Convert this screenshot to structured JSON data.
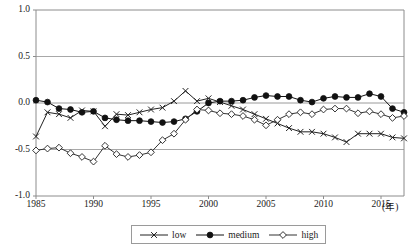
{
  "chart_data": {
    "type": "line",
    "title": "",
    "xlabel": "(年)",
    "ylabel": "",
    "xlim": [
      1985,
      2017
    ],
    "ylim": [
      -1.0,
      1.0
    ],
    "grid": true,
    "grid_axis": "y",
    "legend_position": "bottom-center",
    "y_ticks": [
      "1.0",
      "0.5",
      "0.0",
      "-0.5",
      "-1.0"
    ],
    "y_tick_values": [
      1.0,
      0.5,
      0.0,
      -0.5,
      -1.0
    ],
    "x_ticks": [
      "1985",
      "1990",
      "1995",
      "2000",
      "2005",
      "2010",
      "2015"
    ],
    "x_tick_values": [
      1985,
      1990,
      1995,
      2000,
      2005,
      2010,
      2015
    ],
    "x_axis_unit_label": "(年)",
    "x": [
      1985,
      1986,
      1987,
      1988,
      1989,
      1990,
      1991,
      1992,
      1993,
      1994,
      1995,
      1996,
      1997,
      1998,
      1999,
      2000,
      2001,
      2002,
      2003,
      2004,
      2005,
      2006,
      2007,
      2008,
      2009,
      2010,
      2011,
      2012,
      2013,
      2014,
      2015,
      2016,
      2017
    ],
    "series": [
      {
        "name": "low",
        "marker": "x-cross",
        "marker_fill": "none",
        "color": "#222222",
        "values": [
          -0.36,
          -0.1,
          -0.12,
          -0.16,
          -0.08,
          -0.09,
          -0.25,
          -0.12,
          -0.13,
          -0.1,
          -0.07,
          -0.05,
          0.02,
          0.13,
          0.02,
          0.05,
          0.01,
          -0.03,
          -0.07,
          -0.12,
          -0.17,
          -0.22,
          -0.27,
          -0.31,
          -0.31,
          -0.33,
          -0.37,
          -0.42,
          -0.33,
          -0.33,
          -0.33,
          -0.37,
          -0.38
        ]
      },
      {
        "name": "medium",
        "marker": "filled-circle",
        "marker_fill": "#111111",
        "color": "#111111",
        "values": [
          0.03,
          0.01,
          -0.06,
          -0.07,
          -0.1,
          -0.09,
          -0.16,
          -0.18,
          -0.19,
          -0.19,
          -0.2,
          -0.21,
          -0.2,
          -0.17,
          -0.09,
          0.0,
          0.02,
          0.02,
          0.03,
          0.06,
          0.08,
          0.07,
          0.07,
          0.03,
          0.01,
          0.05,
          0.07,
          0.06,
          0.06,
          0.1,
          0.07,
          -0.06,
          -0.1
        ]
      },
      {
        "name": "high",
        "marker": "open-diamond",
        "marker_fill": "#ffffff",
        "color": "#333333",
        "values": [
          -0.51,
          -0.49,
          -0.48,
          -0.54,
          -0.58,
          -0.63,
          -0.46,
          -0.55,
          -0.58,
          -0.56,
          -0.53,
          -0.4,
          -0.33,
          -0.18,
          -0.07,
          -0.08,
          -0.11,
          -0.12,
          -0.14,
          -0.18,
          -0.24,
          -0.18,
          -0.12,
          -0.1,
          -0.12,
          -0.07,
          -0.06,
          -0.06,
          -0.11,
          -0.09,
          -0.12,
          -0.16,
          -0.14
        ]
      }
    ]
  },
  "legend": {
    "items": [
      {
        "label": "low",
        "marker": "x-cross"
      },
      {
        "label": "medium",
        "marker": "filled-circle"
      },
      {
        "label": "high",
        "marker": "open-diamond"
      }
    ]
  },
  "colors": {
    "axis": "#8c8c8c",
    "grid": "#a8a8a8",
    "zero_line": "#9a9a9a",
    "text": "#1a1a1a",
    "plot_background": "#ffffff"
  }
}
